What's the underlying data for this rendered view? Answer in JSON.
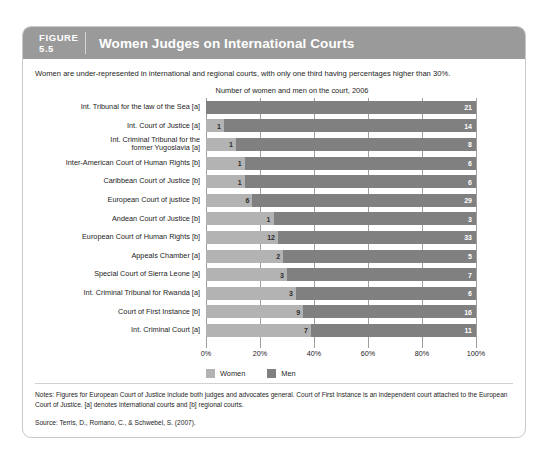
{
  "figure": {
    "number_label": "FIGURE",
    "number": "5.5",
    "title": "Women Judges on International Courts",
    "subtitle": "Women are under-represented in international and regional courts, with only one third having percentages higher than 30%.",
    "notes": "Notes: Figures for European Court of Justice include both judges and advocates general. Court of First Instance is an independent court attached to the European Court of Justice. [a] denotes international courts and [b] regional courts.",
    "source": "Source: Terris, D., Romano, C., & Schwebel, S. (2007)."
  },
  "colors": {
    "header_bg": "#9a9a9a",
    "header_text": "#ffffff",
    "women_bar": "#b3b3b3",
    "men_bar": "#808080",
    "card_border": "#c9c9c9",
    "gridline": "#9e9e9e"
  },
  "chart_data": {
    "type": "bar",
    "orientation": "horizontal",
    "stacked": true,
    "normalized": true,
    "title": "Number of women and men on the court, 2006",
    "xlabel": "",
    "ylabel": "",
    "xlim": [
      0,
      100
    ],
    "xticks": [
      "0%",
      "20%",
      "40%",
      "60%",
      "80%",
      "100%"
    ],
    "xtick_values": [
      0,
      20,
      40,
      60,
      80,
      100
    ],
    "grid": true,
    "legend_position": "bottom-left",
    "legend": [
      "Women",
      "Men"
    ],
    "series": [
      {
        "name": "Women",
        "color": "#b3b3b3",
        "values": [
          0,
          1,
          1,
          1,
          1,
          6,
          1,
          12,
          2,
          3,
          3,
          9,
          7
        ]
      },
      {
        "name": "Men",
        "color": "#808080",
        "values": [
          21,
          14,
          8,
          6,
          6,
          29,
          3,
          33,
          5,
          7,
          6,
          16,
          11
        ]
      }
    ],
    "categories": [
      "Int. Tribunal for the law of the Sea [a]",
      "Int. Court of Justice [a]",
      "Int. Criminal Tribunal for the former Yugoslavia [a]",
      "Inter-American Court of Human Rights [b]",
      "Caribbean Court of Justice [b]",
      "European Court of justice [b]",
      "Andean Court of Justice [b]",
      "European Court of Human Rights [b]",
      "Appeals Chamber [a]",
      "Special Court of Sierra Leone [a]",
      "Int. Criminal Tribunal for Rwanda [a]",
      "Court of First Instance [b]",
      "Int. Criminal Court [a]"
    ],
    "rows": [
      {
        "label_lines": [
          "Int. Tribunal for the law of the Sea [a]"
        ],
        "women": 0,
        "men": 21
      },
      {
        "label_lines": [
          "Int. Court of Justice [a]"
        ],
        "women": 1,
        "men": 14
      },
      {
        "label_lines": [
          "Int. Criminal Tribunal for the",
          "former Yugoslavia [a]"
        ],
        "women": 1,
        "men": 8
      },
      {
        "label_lines": [
          "Inter-American Court of Human Rights [b]"
        ],
        "women": 1,
        "men": 6
      },
      {
        "label_lines": [
          "Caribbean Court of Justice [b]"
        ],
        "women": 1,
        "men": 6
      },
      {
        "label_lines": [
          "European Court of justice [b]"
        ],
        "women": 6,
        "men": 29
      },
      {
        "label_lines": [
          "Andean Court of Justice [b]"
        ],
        "women": 1,
        "men": 3
      },
      {
        "label_lines": [
          "European Court of Human Rights [b]"
        ],
        "women": 12,
        "men": 33
      },
      {
        "label_lines": [
          "Appeals Chamber [a]"
        ],
        "women": 2,
        "men": 5
      },
      {
        "label_lines": [
          "Special Court of Sierra Leone [a]"
        ],
        "women": 3,
        "men": 7
      },
      {
        "label_lines": [
          "Int. Criminal Tribunal for Rwanda [a]"
        ],
        "women": 3,
        "men": 6
      },
      {
        "label_lines": [
          "Court of First Instance [b]"
        ],
        "women": 9,
        "men": 16
      },
      {
        "label_lines": [
          "Int. Criminal Court [a]"
        ],
        "women": 7,
        "men": 11
      }
    ]
  }
}
